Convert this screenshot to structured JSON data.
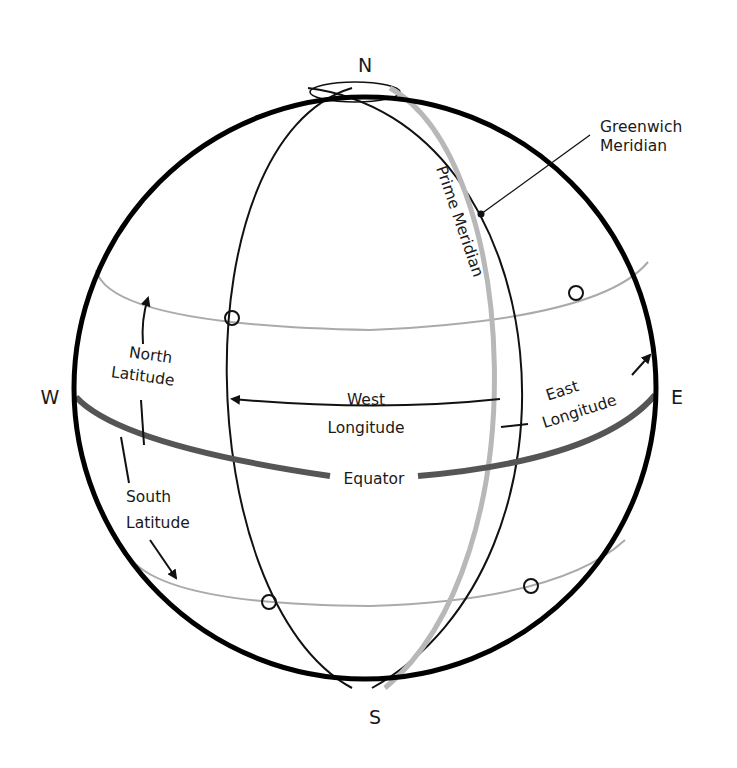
{
  "compass": {
    "north": "N",
    "south": "S",
    "west": "W",
    "east": "E"
  },
  "labels": {
    "greenwich_line1": "Greenwich",
    "greenwich_line2": "Meridian",
    "prime_meridian": "Prime Meridian",
    "north_latitude_line1": "North",
    "north_latitude_line2": "Latitude",
    "south_latitude_line1": "South",
    "south_latitude_line2": "Latitude",
    "west_longitude_line1": "West",
    "west_longitude_line2": "Longitude",
    "east_longitude_line1": "East",
    "east_longitude_line2": "Longitude",
    "equator": "Equator"
  },
  "colors": {
    "outline": "#000000",
    "equator": "#555555",
    "latitude": "#aaaaaa",
    "prime_meridian": "#b8b8b8",
    "meridian": "#111111"
  }
}
